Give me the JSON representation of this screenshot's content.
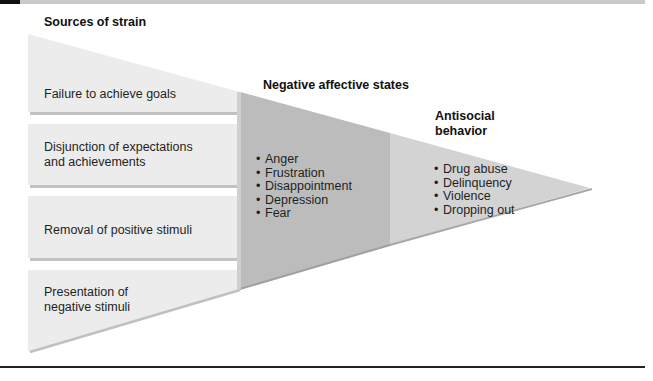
{
  "colors": {
    "light_block": "#ececec",
    "light_shadow": "#c4c4c4",
    "middle_section": "#bdbdbd",
    "right_section": "#d6d6d6",
    "text": "#1f1f1f",
    "rule": "#222222"
  },
  "sources": {
    "heading": "Sources of strain",
    "items": [
      {
        "label": "Failure to achieve goals"
      },
      {
        "label_line1": "Disjunction of expectations",
        "label_line2": "and achievements"
      },
      {
        "label": "Removal of positive stimuli"
      },
      {
        "label_line1": "Presentation of",
        "label_line2": "negative stimuli"
      }
    ]
  },
  "negative_states": {
    "heading": "Negative affective states",
    "items": [
      "Anger",
      "Frustration",
      "Disappointment",
      "Depression",
      "Fear"
    ]
  },
  "antisocial": {
    "heading_line1": "Antisocial",
    "heading_line2": "behavior",
    "items": [
      "Drug abuse",
      "Delinquency",
      "Violence",
      "Dropping out"
    ]
  }
}
